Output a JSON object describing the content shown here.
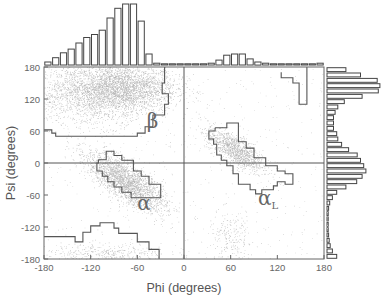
{
  "chart_data": {
    "type": "scatter",
    "title": "",
    "xlabel": "Phi (degrees)",
    "ylabel": "Psi (degrees)",
    "xlim": [
      -180,
      180
    ],
    "ylim": [
      -180,
      180
    ],
    "xticks": [
      -180,
      -120,
      -60,
      0,
      60,
      120,
      180
    ],
    "yticks": [
      -180,
      -120,
      -60,
      0,
      60,
      120,
      180
    ],
    "grid": false,
    "reference_lines": {
      "x": 0,
      "y": 0
    },
    "region_labels": [
      {
        "label": "β",
        "phi": -48,
        "psi": 65
      },
      {
        "label": "α",
        "phi": -60,
        "psi": -88
      },
      {
        "label": "αL",
        "phi": 95,
        "psi": -78
      }
    ],
    "density_clusters": [
      {
        "region": "beta",
        "phi_center": -80,
        "psi_center": 140,
        "phi_spread": 35,
        "psi_spread": 22,
        "relative_density": 1.0
      },
      {
        "region": "beta-broad",
        "phi_center": -120,
        "psi_center": 130,
        "phi_spread": 40,
        "psi_spread": 30,
        "relative_density": 0.6
      },
      {
        "region": "alpha",
        "phi_center": -75,
        "psi_center": -35,
        "phi_spread": 25,
        "psi_spread": 18,
        "relative_density": 0.9
      },
      {
        "region": "alphaL",
        "phi_center": 65,
        "psi_center": 25,
        "phi_spread": 18,
        "psi_spread": 14,
        "relative_density": 0.45
      },
      {
        "region": "lower",
        "phi_center": -100,
        "psi_center": -170,
        "phi_spread": 40,
        "psi_spread": 10,
        "relative_density": 0.15
      },
      {
        "region": "alphaL-low",
        "phi_center": 60,
        "psi_center": -140,
        "phi_spread": 15,
        "psi_spread": 25,
        "relative_density": 0.08
      }
    ],
    "phi_histogram": {
      "bin_width": 10,
      "bin_starts": [
        -180,
        -170,
        -160,
        -150,
        -140,
        -130,
        -120,
        -110,
        -100,
        -90,
        -80,
        -70,
        -60,
        -50,
        -40,
        -30,
        -20,
        -10,
        0,
        10,
        20,
        30,
        40,
        50,
        60,
        70,
        80,
        90,
        100,
        110,
        120,
        130,
        140,
        150,
        160,
        170
      ],
      "relative_counts": [
        0.05,
        0.12,
        0.2,
        0.26,
        0.36,
        0.45,
        0.5,
        0.57,
        0.77,
        0.93,
        1.0,
        1.0,
        0.72,
        0.18,
        0.03,
        0.02,
        0.01,
        0.01,
        0.01,
        0.01,
        0.01,
        0.03,
        0.08,
        0.16,
        0.18,
        0.18,
        0.1,
        0.05,
        0.03,
        0.02,
        0.02,
        0.02,
        0.02,
        0.02,
        0.02,
        0.03
      ]
    },
    "psi_histogram": {
      "bin_width": 10,
      "bin_starts": [
        180,
        170,
        160,
        150,
        140,
        130,
        120,
        110,
        100,
        90,
        80,
        70,
        60,
        50,
        40,
        30,
        20,
        10,
        0,
        -10,
        -20,
        -30,
        -40,
        -50,
        -60,
        -70,
        -80,
        -90,
        -100,
        -110,
        -120,
        -130,
        -140,
        -150,
        -160,
        -170
      ],
      "relative_counts": [
        0.35,
        0.62,
        0.93,
        0.98,
        0.95,
        0.65,
        0.32,
        0.2,
        0.15,
        0.12,
        0.12,
        0.12,
        0.18,
        0.2,
        0.27,
        0.4,
        0.56,
        0.62,
        0.68,
        0.72,
        0.65,
        0.55,
        0.35,
        0.18,
        0.1,
        0.05,
        0.03,
        0.02,
        0.02,
        0.02,
        0.02,
        0.03,
        0.04,
        0.06,
        0.1,
        0.18
      ]
    },
    "region_outlines": {
      "beta": [
        [
          -180,
          62
        ],
        [
          -170,
          62
        ],
        [
          -170,
          56
        ],
        [
          -165,
          56
        ],
        [
          -165,
          50
        ],
        [
          -60,
          50
        ],
        [
          -60,
          56
        ],
        [
          -50,
          56
        ],
        [
          -50,
          68
        ],
        [
          -40,
          68
        ],
        [
          -40,
          90
        ],
        [
          -25,
          90
        ],
        [
          -25,
          110
        ],
        [
          -20,
          110
        ],
        [
          -20,
          130
        ],
        [
          -28,
          130
        ],
        [
          -28,
          150
        ],
        [
          -25,
          150
        ],
        [
          -25,
          180
        ]
      ],
      "alpha": [
        [
          -110,
          6
        ],
        [
          -100,
          6
        ],
        [
          -100,
          22
        ],
        [
          -90,
          22
        ],
        [
          -90,
          14
        ],
        [
          -80,
          14
        ],
        [
          -80,
          5
        ],
        [
          -65,
          5
        ],
        [
          -65,
          -15
        ],
        [
          -55,
          -15
        ],
        [
          -55,
          -25
        ],
        [
          -45,
          -25
        ],
        [
          -45,
          -40
        ],
        [
          -30,
          -40
        ],
        [
          -30,
          -65
        ],
        [
          -68,
          -65
        ],
        [
          -68,
          -55
        ],
        [
          -80,
          -55
        ],
        [
          -80,
          -45
        ],
        [
          -90,
          -45
        ],
        [
          -90,
          -35
        ],
        [
          -98,
          -35
        ],
        [
          -98,
          -25
        ],
        [
          -105,
          -25
        ],
        [
          -105,
          -15
        ],
        [
          -112,
          -15
        ],
        [
          -112,
          0
        ],
        [
          -110,
          0
        ],
        [
          -110,
          6
        ]
      ],
      "alphaL": [
        [
          40,
          66
        ],
        [
          55,
          66
        ],
        [
          55,
          75
        ],
        [
          70,
          75
        ],
        [
          70,
          40
        ],
        [
          80,
          40
        ],
        [
          80,
          28
        ],
        [
          90,
          28
        ],
        [
          90,
          10
        ],
        [
          105,
          10
        ],
        [
          105,
          -5
        ],
        [
          120,
          -5
        ],
        [
          120,
          -15
        ],
        [
          130,
          -15
        ],
        [
          130,
          -20
        ],
        [
          140,
          -20
        ],
        [
          140,
          -40
        ],
        [
          130,
          -40
        ],
        [
          130,
          -35
        ],
        [
          120,
          -35
        ],
        [
          120,
          -43
        ],
        [
          115,
          -43
        ],
        [
          115,
          -50
        ],
        [
          100,
          -50
        ],
        [
          100,
          -58
        ],
        [
          92,
          -58
        ],
        [
          92,
          -50
        ],
        [
          85,
          -50
        ],
        [
          85,
          -40
        ],
        [
          70,
          -40
        ],
        [
          70,
          -20
        ],
        [
          63,
          -20
        ],
        [
          63,
          -5
        ],
        [
          55,
          -5
        ],
        [
          55,
          5
        ],
        [
          48,
          5
        ],
        [
          48,
          15
        ],
        [
          42,
          15
        ],
        [
          42,
          35
        ],
        [
          38,
          35
        ],
        [
          38,
          45
        ],
        [
          32,
          45
        ],
        [
          32,
          60
        ],
        [
          40,
          60
        ],
        [
          40,
          66
        ]
      ],
      "topright": [
        [
          125,
          170
        ],
        [
          125,
          160
        ],
        [
          140,
          160
        ],
        [
          140,
          150
        ],
        [
          148,
          150
        ],
        [
          148,
          110
        ],
        [
          158,
          110
        ],
        [
          158,
          180
        ]
      ],
      "lower": [
        [
          -180,
          -138
        ],
        [
          -140,
          -138
        ],
        [
          -140,
          -148
        ],
        [
          -130,
          -148
        ],
        [
          -130,
          -130
        ],
        [
          -120,
          -130
        ],
        [
          -120,
          -118
        ],
        [
          -108,
          -118
        ],
        [
          -108,
          -112
        ],
        [
          -90,
          -112
        ],
        [
          -90,
          -122
        ],
        [
          -84,
          -122
        ],
        [
          -84,
          -132
        ],
        [
          -60,
          -132
        ],
        [
          -60,
          -148
        ],
        [
          -45,
          -148
        ],
        [
          -45,
          -162
        ],
        [
          -32,
          -162
        ],
        [
          -32,
          -180
        ]
      ]
    }
  }
}
